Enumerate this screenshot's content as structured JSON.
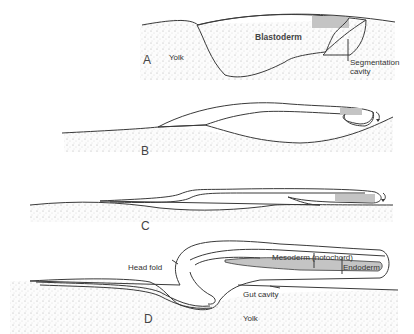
{
  "figure": {
    "colors": {
      "background": "#ffffff",
      "yolk_stipple": "#d8d8d8",
      "blastoderm_fill": "#e6e6e6",
      "mesoderm_fill": "#bdbdbd",
      "line": "#3a3a3a"
    },
    "panels": [
      {
        "id": "A",
        "stage_label": "A",
        "labels": {
          "yolk": "Yolk",
          "blastoderm": "Blastoderm",
          "segmentation_cavity_1": "Segmentation",
          "segmentation_cavity_2": "cavity"
        }
      },
      {
        "id": "B",
        "stage_label": "B"
      },
      {
        "id": "C",
        "stage_label": "C"
      },
      {
        "id": "D",
        "stage_label": "D",
        "labels": {
          "head_fold": "Head fold",
          "mesoderm": "Mesoderm (notochord)",
          "endoderm": "Endoderm",
          "gut_cavity": "Gut cavity",
          "yolk": "Yolk"
        }
      }
    ]
  }
}
